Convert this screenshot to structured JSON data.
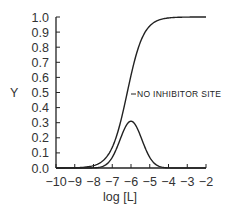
{
  "chart_data": {
    "type": "line",
    "title": "",
    "xlabel": "log [L]",
    "ylabel": "Y",
    "xlim": [
      -10,
      -2
    ],
    "ylim": [
      0.0,
      1.0
    ],
    "grid": false,
    "x_ticks": [
      "-10",
      "-9",
      "-8",
      "-7",
      "-6",
      "-5",
      "-4",
      "-3",
      "-2"
    ],
    "y_ticks": [
      "0.0",
      "0.1",
      "0.2",
      "0.3",
      "0.4",
      "0.5",
      "0.6",
      "0.7",
      "0.8",
      "0.9",
      "1.0"
    ],
    "x": [
      -10,
      -9,
      -8,
      -7.5,
      -7,
      -6.5,
      -6.2,
      -6,
      -5.5,
      -5,
      -4.5,
      -4,
      -3,
      -2
    ],
    "series": [
      {
        "name": "NO INHIBITOR SITE",
        "values": [
          0.0,
          0.0,
          0.01,
          0.05,
          0.14,
          0.33,
          0.5,
          0.61,
          0.82,
          0.94,
          0.98,
          0.995,
          1.0,
          1.0
        ]
      },
      {
        "name": "With inhibitor site (bell-shaped)",
        "values": [
          0.0,
          0.0,
          0.01,
          0.03,
          0.1,
          0.25,
          0.3,
          0.31,
          0.25,
          0.13,
          0.05,
          0.01,
          0.0,
          0.0
        ]
      }
    ],
    "annotations": [
      {
        "text": "NO INHIBITOR SITE",
        "points_to": "sigmoid curve",
        "at_y": 0.5
      }
    ]
  }
}
